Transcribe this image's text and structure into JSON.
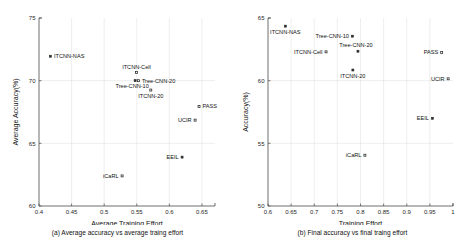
{
  "figure": {
    "panels": [
      "a",
      "b"
    ]
  },
  "chart_data": [
    {
      "type": "scatter",
      "panel_id": "a",
      "title": "",
      "caption": "(a) Average accuracy vs average traing effort",
      "xlabel": "Average Training Effort",
      "ylabel": "Average Accuracy(%)",
      "xlim": [
        0.4,
        0.67
      ],
      "ylim": [
        60,
        75
      ],
      "xticks": [
        0.4,
        0.45,
        0.5,
        0.55,
        0.6,
        0.65
      ],
      "xticklabels": [
        "0.4",
        "0.45",
        "0.5",
        "0.55",
        "0.6",
        "0.65"
      ],
      "yticks": [
        60,
        65,
        70,
        75
      ],
      "yticklabels": [
        "60",
        "65",
        "70",
        "75"
      ],
      "grid": true,
      "legend": "none",
      "points": [
        {
          "label": "ITCNN-NAS",
          "x": 0.4175,
          "y": 71.95,
          "marker": "filled-square",
          "label_pos": "right"
        },
        {
          "label": "ITCNN-Cell",
          "x": 0.5495,
          "y": 70.65,
          "marker": "open-square",
          "label_pos": "above"
        },
        {
          "label": "Tree-CNN-10",
          "x": 0.5475,
          "y": 70.0,
          "marker": "filled-square",
          "label_pos": "below-left"
        },
        {
          "label": "Tree-CNN-20",
          "x": 0.5525,
          "y": 70.0,
          "marker": "open-square",
          "label_pos": "right"
        },
        {
          "label": "ITCNN-20",
          "x": 0.5715,
          "y": 69.25,
          "marker": "open-square",
          "label_pos": "below"
        },
        {
          "label": "PASS",
          "x": 0.6455,
          "y": 67.95,
          "marker": "open-square",
          "label_pos": "right"
        },
        {
          "label": "UCIR",
          "x": 0.6395,
          "y": 66.85,
          "marker": "open-square",
          "label_pos": "left"
        },
        {
          "label": "EEIL",
          "x": 0.6195,
          "y": 63.9,
          "marker": "filled-square",
          "label_pos": "left"
        },
        {
          "label": "iCaRL",
          "x": 0.5275,
          "y": 62.4,
          "marker": "open-square",
          "label_pos": "left"
        }
      ]
    },
    {
      "type": "scatter",
      "panel_id": "b",
      "title": "",
      "caption": "(b) Final accuracy vs final traing effort",
      "xlabel": "Training Effort",
      "ylabel": "Accuracy(%)",
      "xlim": [
        0.6,
        1.0
      ],
      "ylim": [
        50,
        65
      ],
      "xticks": [
        0.6,
        0.65,
        0.7,
        0.75,
        0.8,
        0.85,
        0.9,
        0.95,
        1.0
      ],
      "xticklabels": [
        "0.6",
        "0.65",
        "0.7",
        "0.75",
        "0.8",
        "0.85",
        "0.9",
        "0.95",
        "1"
      ],
      "yticks": [
        50,
        55,
        60,
        65
      ],
      "yticklabels": [
        "50",
        "55",
        "60",
        "65"
      ],
      "grid": true,
      "legend": "none",
      "points": [
        {
          "label": "ITCNN-NAS",
          "x": 0.6375,
          "y": 64.35,
          "marker": "filled-square",
          "label_pos": "below"
        },
        {
          "label": "Tree-CNN-10",
          "x": 0.7825,
          "y": 63.55,
          "marker": "filled-square",
          "label_pos": "left-inline"
        },
        {
          "label": "Tree-CNN-20",
          "x": 0.7945,
          "y": 62.35,
          "marker": "filled-square",
          "label_pos": "above-left"
        },
        {
          "label": "ITCNN-Cell",
          "x": 0.7255,
          "y": 62.3,
          "marker": "open-square",
          "label_pos": "left"
        },
        {
          "label": "ITCNN-20",
          "x": 0.7835,
          "y": 60.85,
          "marker": "filled-square",
          "label_pos": "below"
        },
        {
          "label": "PASS",
          "x": 0.9755,
          "y": 62.25,
          "marker": "open-square",
          "label_pos": "left"
        },
        {
          "label": "UCIR",
          "x": 0.9895,
          "y": 60.15,
          "marker": "open-square",
          "label_pos": "left"
        },
        {
          "label": "EEIL",
          "x": 0.9555,
          "y": 57.0,
          "marker": "filled-square",
          "label_pos": "left"
        },
        {
          "label": "iCaRL",
          "x": 0.8095,
          "y": 54.05,
          "marker": "open-square",
          "label_pos": "left"
        }
      ]
    }
  ]
}
